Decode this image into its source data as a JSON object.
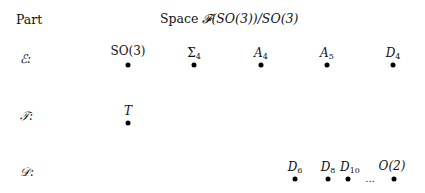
{
  "header": {
    "part_label": "Part",
    "space_label_prefix": "Space ",
    "space_label_math": "𝓕(SO(3))/SO(3)"
  },
  "rows": [
    {
      "name": "E",
      "label": "ℰ:",
      "y": 65,
      "nodes": [
        {
          "label": "SO(3)",
          "base": "SO(3)",
          "sub": "",
          "x": 128,
          "upright": true
        },
        {
          "label": "Σ4",
          "base": "Σ",
          "sub": "4",
          "x": 194,
          "upright": true
        },
        {
          "label": "A4",
          "base": "A",
          "sub": "4",
          "x": 261,
          "upright": false
        },
        {
          "label": "A5",
          "base": "A",
          "sub": "5",
          "x": 327,
          "upright": false
        },
        {
          "label": "D4",
          "base": "D",
          "sub": "4",
          "x": 393,
          "upright": false
        }
      ]
    },
    {
      "name": "T",
      "label": "𝒯:",
      "y": 123,
      "nodes": [
        {
          "label": "T",
          "base": "T",
          "sub": "",
          "x": 128,
          "upright": false
        }
      ]
    },
    {
      "name": "D",
      "label": "𝒟:",
      "y": 179,
      "nodes": [
        {
          "label": "D6",
          "base": "D",
          "sub": "6",
          "x": 295,
          "upright": false
        },
        {
          "label": "D8",
          "base": "D",
          "sub": "8",
          "x": 328,
          "upright": false
        },
        {
          "label": "D10",
          "base": "D",
          "sub": "10",
          "x": 348,
          "upright": false
        },
        {
          "label": "O(2)",
          "base": "O(2)",
          "sub": "",
          "x": 394,
          "upright": false
        }
      ],
      "ellipsis": {
        "text": "...",
        "x": 370
      }
    }
  ]
}
